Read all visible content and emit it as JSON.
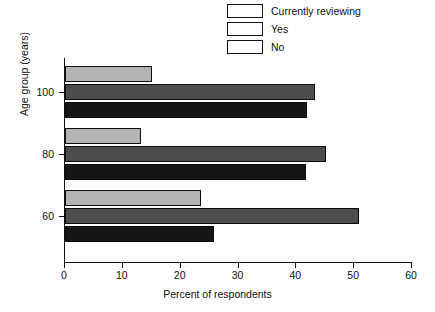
{
  "chart_data": {
    "type": "bar",
    "orientation": "horizontal",
    "title": "",
    "xlabel": "Percent of respondents",
    "ylabel": "Age group (years)",
    "categories": [
      "60",
      "80",
      "100"
    ],
    "series": [
      {
        "name": "Currently reviewing",
        "color": "#b3b3b3",
        "values": [
          23.5,
          13.1,
          15.0
        ]
      },
      {
        "name": "Yes",
        "color": "#4d4d4d",
        "values": [
          50.9,
          45.2,
          43.3
        ]
      },
      {
        "name": "No",
        "color": "#161616",
        "values": [
          25.8,
          41.7,
          41.9
        ]
      }
    ],
    "xlim": [
      0,
      60
    ],
    "xticks": [
      0,
      10,
      20,
      30,
      40,
      50,
      60
    ],
    "xtick_labels": [
      "0",
      "10",
      "20",
      "30",
      "40",
      "50",
      "60"
    ],
    "ytick_labels": [
      "60",
      "80",
      "100"
    ],
    "grid": false,
    "legend_position": "top-right"
  },
  "legend": {
    "items": [
      {
        "label": "Currently reviewing",
        "swatch": "legend-swatch-currently-reviewing"
      },
      {
        "label": "Yes",
        "swatch": "legend-swatch-yes"
      },
      {
        "label": "No",
        "swatch": "legend-swatch-no"
      }
    ]
  },
  "axes": {
    "x_title": "Percent of respondents",
    "y_title": "Age group (years)"
  }
}
